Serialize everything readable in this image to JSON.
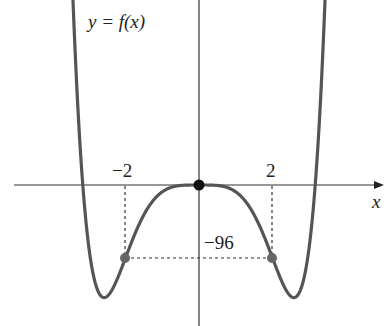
{
  "chart_data": {
    "type": "line",
    "title": "y = f(x)",
    "function_label": "y = f(x)",
    "xlabel": "x",
    "ylabel": "",
    "formula_fit": "f(x) = x^6 - 10x^4",
    "x_ticks": [
      {
        "value": -2,
        "label": "−2"
      },
      {
        "value": 2,
        "label": "2"
      }
    ],
    "annotations": [
      {
        "type": "point",
        "x": 0,
        "y": 0,
        "style": "filled-black"
      },
      {
        "type": "point",
        "x": -2,
        "y": -96,
        "style": "filled-gray"
      },
      {
        "type": "point",
        "x": 2,
        "y": -96,
        "style": "filled-gray"
      },
      {
        "type": "dashed-line",
        "from": [
          -2,
          0
        ],
        "to": [
          -2,
          -96
        ]
      },
      {
        "type": "dashed-line",
        "from": [
          2,
          0
        ],
        "to": [
          2,
          -96
        ]
      },
      {
        "type": "dashed-line",
        "from": [
          -2,
          -96
        ],
        "to": [
          2,
          -96
        ]
      },
      {
        "type": "text",
        "label": "−96",
        "at": [
          0.6,
          -80
        ]
      }
    ],
    "series": [
      {
        "name": "f(x)",
        "x": [
          -3.5,
          -3.16,
          -2.58,
          -2,
          -1,
          0,
          1,
          2,
          2.58,
          3.16,
          3.5
        ],
        "values": [
          346,
          0,
          -148,
          -96,
          -9,
          0,
          -9,
          -96,
          -148,
          0,
          346
        ]
      }
    ],
    "grid": false,
    "legend": "none"
  },
  "labels": {
    "title": "y = f(x)",
    "x_axis": "x",
    "tick_neg2": "−2",
    "tick_pos2": "2",
    "value_neg96": "−96"
  }
}
